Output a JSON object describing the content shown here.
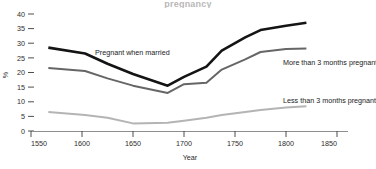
{
  "title": {
    "text": "pregnancy"
  },
  "axes": {
    "y_label": "%",
    "x_label": "Year",
    "y_ticks": [
      "0",
      "5",
      "10",
      "15",
      "20",
      "25",
      "30",
      "35",
      "40"
    ],
    "x_ticks": [
      "1550",
      "1600",
      "1650",
      "1700",
      "1750",
      "1800",
      "1850"
    ]
  },
  "labels": {
    "series1": "Pregnant when married",
    "series2": "More than 3 months pregnant",
    "series3": "Less than 3 months pregnant"
  },
  "colors": {
    "series1": "#141414",
    "series2": "#666666",
    "series3": "#b4b4b4",
    "axis": "#8f8f8f",
    "text": "#1a1a1a"
  },
  "chart_data": {
    "type": "line",
    "xlabel": "Year",
    "ylabel": "%",
    "xlim": [
      1550,
      1850
    ],
    "ylim": [
      0,
      40
    ],
    "grid": false,
    "legend": "inline-annotations",
    "x": [
      1567,
      1603,
      1625,
      1650,
      1684,
      1700,
      1722,
      1737,
      1760,
      1775,
      1800,
      1820
    ],
    "series": [
      {
        "name": "Pregnant when married",
        "color": "#141414",
        "values": [
          28.5,
          26.5,
          23.0,
          19.5,
          15.5,
          18.5,
          22.0,
          27.5,
          32.0,
          34.5,
          36.0,
          37.0
        ]
      },
      {
        "name": "More than 3 months pregnant",
        "color": "#666666",
        "values": [
          21.5,
          20.5,
          18.0,
          15.5,
          13.0,
          16.0,
          16.5,
          21.0,
          24.5,
          27.0,
          28.0,
          28.2
        ]
      },
      {
        "name": "Less than 3 months pregnant",
        "color": "#b4b4b4",
        "values": [
          6.5,
          5.5,
          4.5,
          2.6,
          2.8,
          3.5,
          4.5,
          5.5,
          6.5,
          7.2,
          8.0,
          8.5
        ]
      }
    ]
  }
}
